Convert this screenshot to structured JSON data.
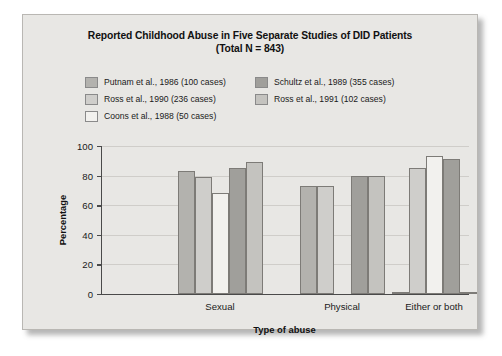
{
  "figure": {
    "title_line1": "Reported Childhood Abuse in Five Separate Studies of DID Patients",
    "title_line2": "(Total N = 843)",
    "background_color": "#e8e7e4",
    "frame_border_color": "#b9b7b3"
  },
  "chart_data": {
    "type": "bar",
    "title": "Reported Childhood Abuse in Five Separate Studies of DID Patients (Total N = 843)",
    "xlabel": "Type of abuse",
    "ylabel": "Percentage",
    "categories": [
      "Sexual",
      "Physical",
      "Either or both"
    ],
    "ylim": [
      0,
      100
    ],
    "yticks": [
      0,
      20,
      40,
      60,
      80,
      100
    ],
    "ytick_labels": [
      "0",
      "20",
      "40",
      "60",
      "80",
      "100"
    ],
    "grid": true,
    "legend_position": "top",
    "series": [
      {
        "name": "Putnam et al., 1986 (100 cases)",
        "color": "#b3b2ae",
        "values": [
          83,
          73,
          1
        ]
      },
      {
        "name": "Ross et al., 1990 (236 cases)",
        "color": "#cfcecb",
        "values": [
          79,
          73,
          85
        ]
      },
      {
        "name": "Coons et al., 1988 (50 cases)",
        "color": "#f2f1ee",
        "values": [
          68,
          0,
          93
        ]
      },
      {
        "name": "Schultz et al., 1989 (355 cases)",
        "color": "#a09f9b",
        "values": [
          85,
          80,
          91
        ]
      },
      {
        "name": "Ross et al., 1991 (102 cases)",
        "color": "#c4c3bf",
        "values": [
          89,
          80,
          1
        ]
      }
    ]
  },
  "legend": {
    "left_column": [
      {
        "label": "Putnam et al., 1986 (100 cases)",
        "color": "#b3b2ae"
      },
      {
        "label": "Ross et al., 1990 (236 cases)",
        "color": "#cfcecb"
      },
      {
        "label": "Coons et al., 1988 (50 cases)",
        "color": "#f2f1ee"
      }
    ],
    "right_column": [
      {
        "label": "Schultz et al., 1989 (355 cases)",
        "color": "#a09f9b"
      },
      {
        "label": "Ross et al., 1991 (102 cases)",
        "color": "#c4c3bf"
      }
    ]
  }
}
